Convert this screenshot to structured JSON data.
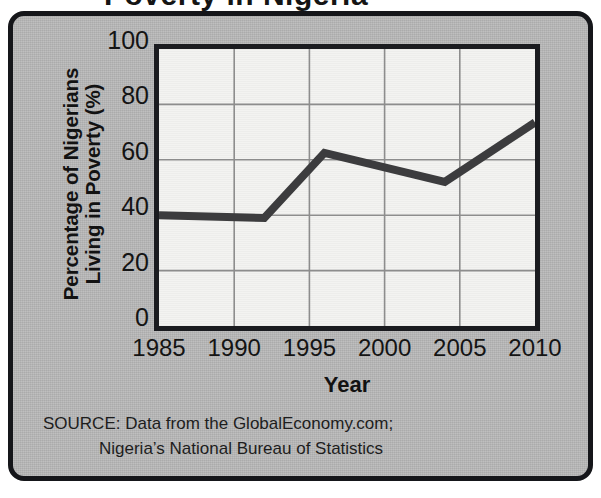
{
  "figure": {
    "title_fragment": "Poverty in Nigeria",
    "panel_background_color": "#b9b9b9",
    "panel_border_color": "#15161a",
    "plot_background_color": "#f3f3f1",
    "grid_color": "#8d8d8d",
    "line_color": "#3c3c3e",
    "text_color": "#141414"
  },
  "axes": {
    "y_title_line1": "Percentage of Nigerians",
    "y_title_line2": "Living in Poverty (%)",
    "x_title": "Year"
  },
  "source": {
    "line1": "SOURCE: Data from the GlobalEconomy.com;",
    "line2": "Nigeria’s National Bureau of Statistics"
  },
  "chart_data": {
    "type": "line",
    "title": "Poverty in Nigeria",
    "xlabel": "Year",
    "ylabel": "Percentage of Nigerians Living in Poverty (%)",
    "xlim": [
      1985,
      2010
    ],
    "ylim": [
      0,
      100
    ],
    "xticks": [
      1985,
      1990,
      1995,
      2000,
      2005,
      2010
    ],
    "yticks": [
      0,
      20,
      40,
      60,
      80,
      100
    ],
    "xtick_labels": [
      "1985",
      "1990",
      "1995",
      "2000",
      "2005",
      "2010"
    ],
    "ytick_labels": [
      "0",
      "20",
      "40",
      "60",
      "80",
      "100"
    ],
    "grid": true,
    "legend": false,
    "series": [
      {
        "name": "Percentage of Nigerians Living in Poverty",
        "x": [
          1985,
          1992,
          1996,
          2004,
          2010
        ],
        "values": [
          40,
          39,
          62.5,
          52,
          73.5
        ]
      }
    ],
    "source": "SOURCE: Data from the GlobalEconomy.com; Nigeria's National Bureau of Statistics"
  }
}
